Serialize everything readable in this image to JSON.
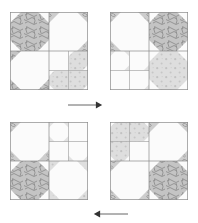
{
  "figure": {
    "type": "quilt-block-rotation-diagram",
    "layout": "2x2 grid of quilt blocks with directional arrows between rows",
    "canvas": {
      "width": 198,
      "height": 223
    },
    "background_color": "#ffffff",
    "line_color": "#7a7a7a",
    "fabrics": {
      "background_label": "white",
      "background_color": "#fbfbfb",
      "light_label": "light-gray-dot-print",
      "light_color": "#d8d8d8",
      "dark_label": "dark-gray-squiggle-print",
      "dark_color": "#bcbcbc",
      "medium_label": "medium-gray-leaf-print",
      "medium_color": "#c9c9c9"
    }
  },
  "blocks": [
    {
      "id": "block-1",
      "name": "block-top-left",
      "position": "top-left",
      "x": 10,
      "y": 12,
      "size": 78,
      "quadrants": [
        {
          "name": "quadrant-top-left",
          "fabric": "dark",
          "motif": "snowball"
        },
        {
          "name": "quadrant-top-right",
          "fabric": "background",
          "motif": "snowball"
        },
        {
          "name": "quadrant-bottom-left",
          "fabric": "background",
          "motif": "snowball"
        },
        {
          "name": "quadrant-bottom-right",
          "fabric": "light",
          "motif": "four-patch-snowball"
        }
      ]
    },
    {
      "id": "block-2",
      "name": "block-top-right",
      "position": "top-right",
      "x": 110,
      "y": 12,
      "size": 78,
      "quadrants": [
        {
          "name": "quadrant-top-left",
          "fabric": "background",
          "motif": "snowball"
        },
        {
          "name": "quadrant-top-right",
          "fabric": "dark",
          "motif": "snowball"
        },
        {
          "name": "quadrant-bottom-left",
          "fabric": "background",
          "motif": "four-patch-snowball"
        },
        {
          "name": "quadrant-bottom-right",
          "fabric": "light",
          "motif": "snowball"
        }
      ]
    },
    {
      "id": "block-3",
      "name": "block-bottom-left",
      "position": "bottom-left",
      "x": 10,
      "y": 122,
      "size": 78,
      "quadrants": [
        {
          "name": "quadrant-top-left",
          "fabric": "background",
          "motif": "snowball"
        },
        {
          "name": "quadrant-top-right",
          "fabric": "background",
          "motif": "four-patch-snowball"
        },
        {
          "name": "quadrant-bottom-left",
          "fabric": "dark",
          "motif": "snowball"
        },
        {
          "name": "quadrant-bottom-right",
          "fabric": "light",
          "motif": "snowball"
        }
      ]
    },
    {
      "id": "block-4",
      "name": "block-bottom-right",
      "position": "bottom-right",
      "x": 110,
      "y": 122,
      "size": 78,
      "quadrants": [
        {
          "name": "quadrant-top-left",
          "fabric": "light",
          "motif": "four-patch-snowball"
        },
        {
          "name": "quadrant-top-right",
          "fabric": "background",
          "motif": "snowball"
        },
        {
          "name": "quadrant-bottom-left",
          "fabric": "background",
          "motif": "snowball"
        },
        {
          "name": "quadrant-bottom-right",
          "fabric": "dark",
          "motif": "snowball"
        }
      ]
    }
  ],
  "arrows": [
    {
      "id": "arrow-top",
      "name": "arrow-rotate-right",
      "direction": "right",
      "x1": 68,
      "y1": 105,
      "x2": 104,
      "y2": 105,
      "color": "#555555"
    },
    {
      "id": "arrow-bottom",
      "name": "arrow-rotate-left",
      "direction": "left",
      "x1": 128,
      "y1": 214,
      "x2": 92,
      "y2": 214,
      "color": "#555555"
    }
  ]
}
